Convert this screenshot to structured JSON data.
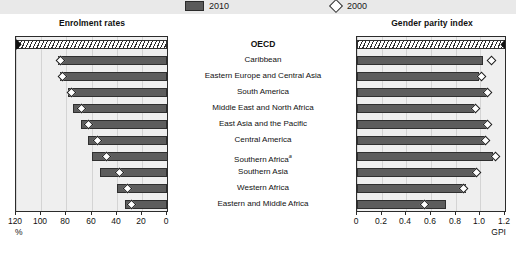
{
  "legend": {
    "items": [
      {
        "key": "2010",
        "label": "2010",
        "marker": "filled-bar",
        "color": "#5d5d5d"
      },
      {
        "key": "2000",
        "label": "2000",
        "marker": "open-diamond",
        "color": "#ffffff"
      }
    ]
  },
  "panels": {
    "left": {
      "title": "Enrolment rates",
      "axis_unit": "%",
      "axis_ticks": [
        "120",
        "100",
        "80",
        "60",
        "40",
        "20",
        "0"
      ]
    },
    "right": {
      "title": "Gender parity index",
      "axis_unit": "GPI",
      "axis_ticks": [
        "0",
        "0.2",
        "0.4",
        "0.6",
        "0.8",
        "1.0",
        "1.2"
      ]
    }
  },
  "chart_data": {
    "type": "bar",
    "orientation": "horizontal",
    "legend_position": "top",
    "grid": true,
    "categories": [
      "OECD",
      "Caribbean",
      "Eastern Europe and Central Asia",
      "South America",
      "Middle East and North Africa",
      "East Asia and the Pacific",
      "Central America",
      "Southern Africa",
      "Southern Asia",
      "Western Africa",
      "Eastern and Middle Africa"
    ],
    "category_footnote_index": 7,
    "category_footnote_marker": "a",
    "panels": [
      {
        "name": "Enrolment rates",
        "xlabel": "%",
        "xlim": [
          0,
          120
        ],
        "reversed": true,
        "series": [
          {
            "name": "2010",
            "type": "bar",
            "values": [
              120,
              87,
              85,
              79,
              75,
              68,
              63,
              60,
              53,
              40,
              33
            ]
          },
          {
            "name": "2000",
            "type": "marker",
            "values": [
              120,
              85,
              83,
              76,
              68,
              62,
              55,
              48,
              38,
              31,
              28
            ]
          }
        ]
      },
      {
        "name": "Gender parity index",
        "xlabel": "GPI",
        "xlim": [
          0,
          1.2
        ],
        "reversed": false,
        "series": [
          {
            "name": "2010",
            "type": "bar",
            "values": [
              1.2,
              1.02,
              0.99,
              1.05,
              0.95,
              1.06,
              1.04,
              1.1,
              0.97,
              0.88,
              0.72
            ]
          },
          {
            "name": "2000",
            "type": "marker",
            "values": [
              1.2,
              1.09,
              1.01,
              1.06,
              0.96,
              1.06,
              1.04,
              1.12,
              0.97,
              0.86,
              0.55
            ]
          }
        ]
      }
    ]
  }
}
